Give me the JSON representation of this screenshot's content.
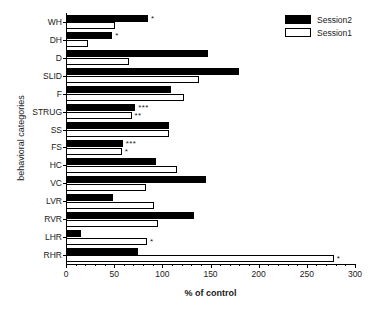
{
  "chart_data": {
    "type": "bar",
    "orientation": "horizontal",
    "title": "",
    "xlabel": "% of control",
    "ylabel": "behavioral categories",
    "xlim": [
      0,
      300
    ],
    "xticks": [
      0,
      50,
      100,
      150,
      200,
      250,
      300
    ],
    "xtick_labels": [
      "0",
      "50",
      "100",
      "150",
      "200",
      "250",
      "300"
    ],
    "xminor_interval": 10,
    "grid": false,
    "legend_position": "top-right",
    "categories": [
      "WH",
      "DH",
      "D",
      "SLID",
      "F",
      "STRUG",
      "SS",
      "FS",
      "HC",
      "VC",
      "LVR",
      "RVR",
      "LHR",
      "RHR"
    ],
    "series": [
      {
        "name": "Session2",
        "style": "filled-black",
        "color": "#000000",
        "values": [
          85,
          48,
          147,
          180,
          109,
          72,
          107,
          59,
          93,
          145,
          49,
          133,
          16,
          75
        ],
        "significance": [
          "*",
          "*",
          "",
          "",
          "",
          "***",
          "",
          "***",
          "",
          "",
          "",
          "",
          "",
          ""
        ]
      },
      {
        "name": "Session1",
        "style": "open-white",
        "color": "#ffffff",
        "values": [
          51,
          23,
          65,
          138,
          123,
          68,
          107,
          58,
          115,
          83,
          91,
          96,
          84,
          278
        ],
        "significance": [
          "",
          "",
          "",
          "",
          "",
          "**",
          "",
          "*",
          "",
          "",
          "",
          "",
          "*",
          "*"
        ]
      }
    ]
  },
  "legend": {
    "entries": [
      {
        "label": "Session2",
        "swatch": "filled"
      },
      {
        "label": "Session1",
        "swatch": "open"
      }
    ]
  },
  "axes": {
    "x_title": "% of control",
    "y_title": "behavioral categories"
  }
}
